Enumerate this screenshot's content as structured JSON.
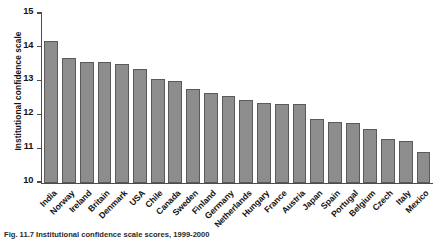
{
  "figure": {
    "caption": "Fig. 11.7  Institutional confidence scale scores, 1999-2000"
  },
  "chart_data": {
    "type": "bar",
    "title": "",
    "xlabel": "",
    "ylabel": "Institutional confidence scale",
    "ylim": [
      10,
      15
    ],
    "yticks": [
      10,
      11,
      12,
      13,
      14,
      15
    ],
    "ytick_labels": [
      "10",
      "11",
      "12",
      "13",
      "14",
      "15"
    ],
    "grid": false,
    "legend": "none",
    "bar_color": "#8d8d8d",
    "bar_edge_color": "#5a5a5a",
    "categories": [
      "India",
      "Norway",
      "Ireland",
      "Britain",
      "Denmark",
      "USA",
      "Chile",
      "Canada",
      "Sweden",
      "Finland",
      "Germany",
      "Netherlands",
      "Hungary",
      "France",
      "Austria",
      "Japan",
      "Spain",
      "Portugal",
      "Belgium",
      "Czech",
      "Italy",
      "Mexico"
    ],
    "values": [
      14.2,
      13.68,
      13.58,
      13.58,
      13.52,
      13.35,
      13.07,
      13.0,
      12.76,
      12.65,
      12.57,
      12.44,
      12.37,
      12.32,
      12.32,
      11.88,
      11.78,
      11.76,
      11.6,
      11.3,
      11.22,
      10.9
    ]
  }
}
